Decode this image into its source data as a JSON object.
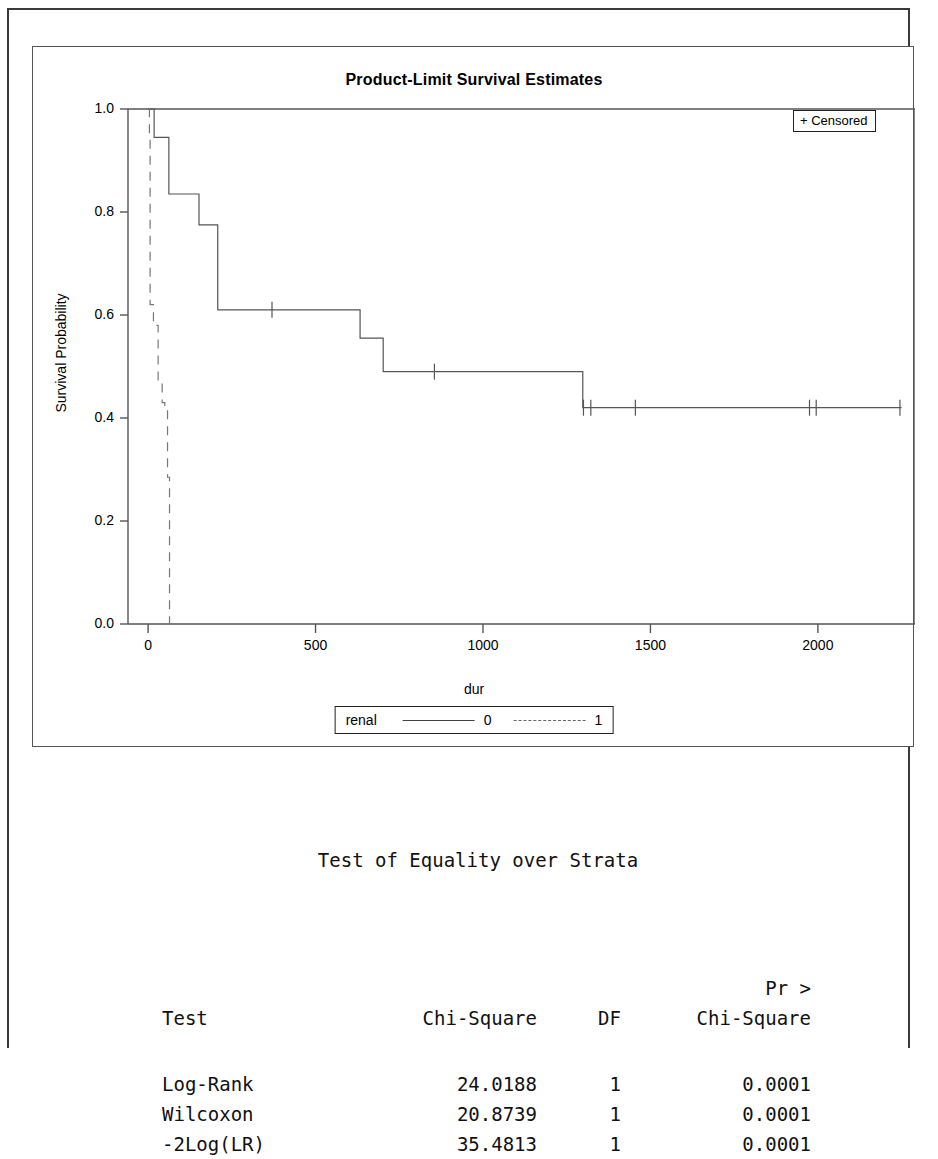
{
  "chart_data": {
    "type": "line",
    "subtype": "kaplan-meier-step",
    "title": "Product-Limit Survival Estimates",
    "xlabel": "dur",
    "ylabel": "Survival Probability",
    "xlim": [
      -60,
      2290
    ],
    "ylim": [
      0.0,
      1.0
    ],
    "grid": false,
    "xticks": [
      0,
      500,
      1000,
      1500,
      2000
    ],
    "xtick_labels": [
      "0",
      "500",
      "1000",
      "1500",
      "2000"
    ],
    "yticks": [
      0.0,
      0.2,
      0.4,
      0.6,
      0.8,
      1.0
    ],
    "ytick_labels": [
      "0.0",
      "0.2",
      "0.4",
      "0.6",
      "0.8",
      "1.0"
    ],
    "legend_position": "below-axis",
    "strata_variable": "renal",
    "censored_legend_label": "+ Censored",
    "censored_marker": "+",
    "series": [
      {
        "name": "0",
        "label": "0",
        "linestyle": "solid",
        "color": "#555555",
        "steps": [
          {
            "x": 0,
            "y": 1.0
          },
          {
            "x": 18,
            "y": 0.945
          },
          {
            "x": 60,
            "y": 0.945
          },
          {
            "x": 62,
            "y": 0.835
          },
          {
            "x": 150,
            "y": 0.835
          },
          {
            "x": 152,
            "y": 0.775
          },
          {
            "x": 205,
            "y": 0.775
          },
          {
            "x": 208,
            "y": 0.61
          },
          {
            "x": 630,
            "y": 0.61
          },
          {
            "x": 633,
            "y": 0.555
          },
          {
            "x": 700,
            "y": 0.555
          },
          {
            "x": 702,
            "y": 0.49
          },
          {
            "x": 1295,
            "y": 0.49
          },
          {
            "x": 1298,
            "y": 0.42
          },
          {
            "x": 2250,
            "y": 0.42
          }
        ],
        "censored_x": [
          370,
          855,
          1300,
          1322,
          1455,
          1975,
          1995,
          2245
        ],
        "censored_y": [
          0.61,
          0.49,
          0.42,
          0.42,
          0.42,
          0.42,
          0.42,
          0.42
        ]
      },
      {
        "name": "1",
        "label": "1",
        "linestyle": "dashed",
        "color": "#777777",
        "steps": [
          {
            "x": 2,
            "y": 1.0
          },
          {
            "x": 4,
            "y": 0.95
          },
          {
            "x": 6,
            "y": 0.62
          },
          {
            "x": 16,
            "y": 0.58
          },
          {
            "x": 30,
            "y": 0.47
          },
          {
            "x": 42,
            "y": 0.43
          },
          {
            "x": 50,
            "y": 0.42
          },
          {
            "x": 56,
            "y": 0.42
          },
          {
            "x": 58,
            "y": 0.285
          },
          {
            "x": 62,
            "y": 0.285
          },
          {
            "x": 64,
            "y": 0.0
          },
          {
            "x": 64,
            "y": 0.0
          }
        ],
        "censored_x": [],
        "censored_y": []
      }
    ]
  },
  "chart": {
    "title": "Product-Limit Survival Estimates",
    "censored_legend": "+ Censored",
    "xlabel": "dur",
    "ylabel": "Survival Probability",
    "legend": {
      "variable": "renal",
      "entries": [
        {
          "label": "0",
          "style": "solid"
        },
        {
          "label": "1",
          "style": "dashed"
        }
      ]
    }
  },
  "stats": {
    "title": "Test of Equality over Strata",
    "headers": {
      "test": "Test",
      "chi_square": "Chi-Square",
      "df": "DF",
      "pr_line1": "Pr >",
      "pr_line2": "Chi-Square"
    },
    "rows": [
      {
        "test": "Log-Rank",
        "chi_square": "24.0188",
        "df": "1",
        "pr": "0.0001"
      },
      {
        "test": "Wilcoxon",
        "chi_square": "20.8739",
        "df": "1",
        "pr": "0.0001"
      },
      {
        "test": "-2Log(LR)",
        "chi_square": "35.4813",
        "df": "1",
        "pr": "0.0001"
      }
    ]
  }
}
